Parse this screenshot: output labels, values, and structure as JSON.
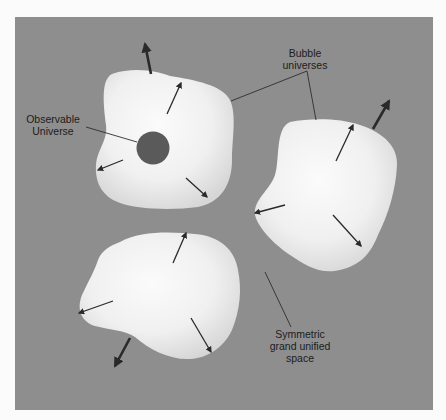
{
  "diagram": {
    "colors": {
      "background_page": "#fbfbfb",
      "space": "#8e8e8e",
      "bubble_light": "#f6f6f6",
      "bubble_shade": "#d9d9d9",
      "observable_universe": "#5a5a5a",
      "arrow": "#2a2a2a",
      "leader_line": "#2e2e2e",
      "text": "#1c1c1c"
    },
    "labels": {
      "observable_universe": {
        "line1": "Observable",
        "line2": "Universe"
      },
      "bubble_universes": {
        "line1": "Bubble",
        "line2": "universes"
      },
      "symmetric_space": {
        "line1": "Symmetric",
        "line2": "grand unified",
        "line3": "space"
      }
    },
    "bubbles": [
      {
        "id": "bubble-top-left",
        "contains_observable_universe": true,
        "arrows_inside": 3,
        "arrows_outside": 1
      },
      {
        "id": "bubble-right",
        "contains_observable_universe": false,
        "arrows_inside": 3,
        "arrows_outside": 1
      },
      {
        "id": "bubble-bottom",
        "contains_observable_universe": false,
        "arrows_inside": 3,
        "arrows_outside": 1
      }
    ]
  }
}
